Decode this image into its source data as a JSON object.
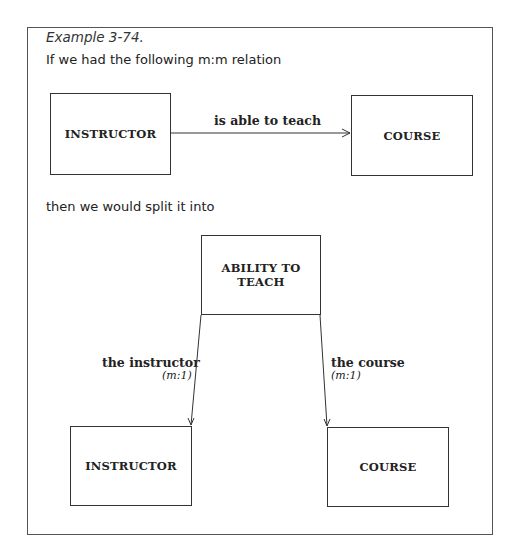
{
  "caption": "Example 3-74.",
  "intro_text": "If we had the following m:m relation",
  "split_text": "then we would split it into",
  "top_diagram": {
    "left_entity": "INSTRUCTOR",
    "right_entity": "COURSE",
    "relationship": "is able to teach"
  },
  "bottom_diagram": {
    "associative_entity_line1": "ABILITY TO",
    "associative_entity_line2": "TEACH",
    "left_entity": "INSTRUCTOR",
    "right_entity": "COURSE",
    "left_relationship": "the instructor",
    "left_cardinality": "(m:1)",
    "right_relationship": "the course",
    "right_cardinality": "(m:1)"
  },
  "colors": {
    "line": "#333333",
    "frame": "#555555",
    "background": "#ffffff"
  }
}
